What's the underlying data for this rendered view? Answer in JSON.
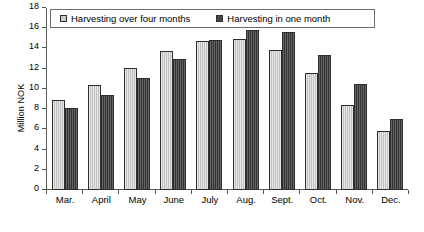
{
  "chart_data": {
    "type": "bar",
    "title": "",
    "xlabel": "",
    "ylabel": "Million NOK",
    "ylim": [
      0,
      18
    ],
    "ytick_step": 2,
    "yticks": [
      0,
      2,
      4,
      6,
      8,
      10,
      12,
      14,
      16,
      18
    ],
    "grid": false,
    "legend_position": "top-inside",
    "categories": [
      "Mar.",
      "April",
      "May",
      "June",
      "July",
      "Aug.",
      "Sept.",
      "Oct.",
      "Nov.",
      "Dec."
    ],
    "series": [
      {
        "name": "Harvesting over four months",
        "color": "#c9c9c9",
        "values": [
          8.9,
          10.4,
          12.1,
          13.7,
          14.7,
          14.9,
          13.8,
          11.6,
          8.4,
          5.8
        ]
      },
      {
        "name": "Harvesting in one month",
        "color": "#474747",
        "values": [
          8.1,
          9.4,
          11.1,
          13.0,
          14.8,
          15.8,
          15.6,
          13.4,
          10.5,
          7.0
        ]
      }
    ]
  },
  "legend": {
    "entries": [
      {
        "label": "Harvesting over four months"
      },
      {
        "label": "Harvesting in one month"
      }
    ]
  }
}
